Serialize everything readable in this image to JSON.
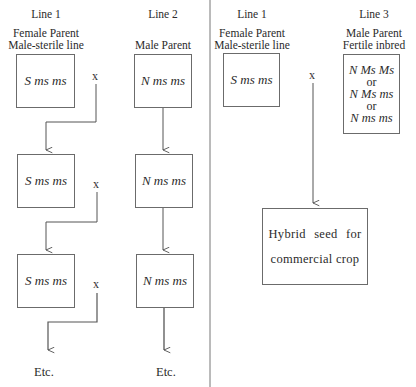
{
  "left_panel": {
    "line1": {
      "title": "Line 1",
      "role": "Female Parent",
      "subrole": "Male-sterile line",
      "boxes": [
        "S ms ms",
        "S ms ms",
        "S ms ms"
      ],
      "etc": "Etc."
    },
    "line2": {
      "title": "Line 2",
      "role": "Male Parent",
      "boxes": [
        "N ms ms",
        "N ms ms",
        "N ms ms"
      ],
      "etc": "Etc."
    },
    "cross_symbol": "x"
  },
  "right_panel": {
    "line1": {
      "title": "Line 1",
      "role": "Female Parent",
      "subrole": "Male-sterile line",
      "box": "S ms ms"
    },
    "line3": {
      "title": "Line 3",
      "role": "Male Parent",
      "subrole": "Fertile inbred",
      "genotypes": [
        "N Ms Ms",
        "or",
        "N Ms ms",
        "or",
        "N ms ms"
      ]
    },
    "cross_symbol": "x",
    "result": {
      "line1": "Hybrid seed for",
      "line2": "commercial crop"
    }
  },
  "colors": {
    "line": "#555555",
    "text": "#2b2b2b",
    "background": "#ffffff"
  }
}
